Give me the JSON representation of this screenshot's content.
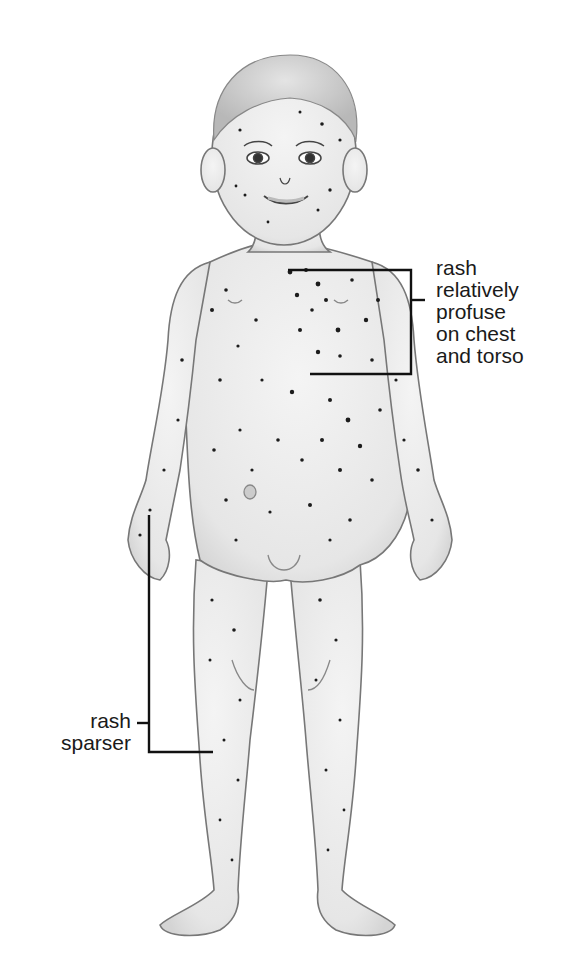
{
  "illustration": {
    "subject": "child-figure-with-rash",
    "skin_color": "#ebebeb",
    "outline_color": "#6e6e6e",
    "spot_color": "#1c1c1c",
    "line_color": "#111111"
  },
  "annotations": {
    "chest": {
      "lines": [
        "rash",
        "relatively",
        "profuse",
        "on chest",
        "and torso"
      ]
    },
    "limbs": {
      "lines": [
        "rash",
        "sparser"
      ]
    }
  }
}
